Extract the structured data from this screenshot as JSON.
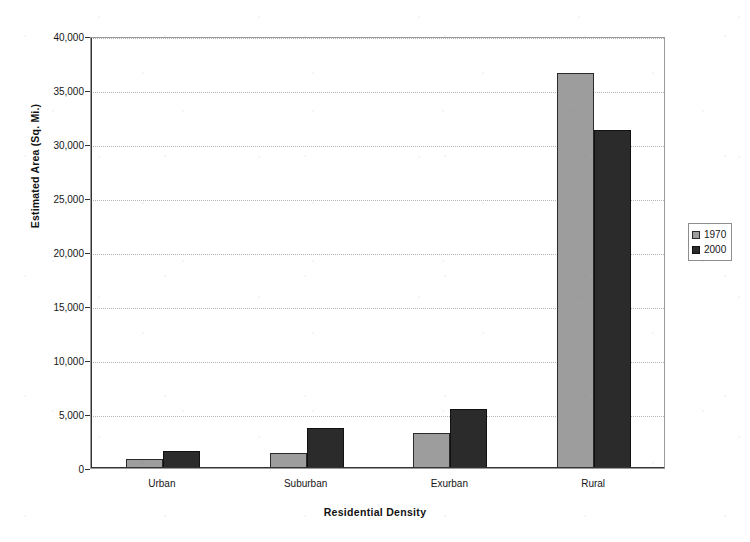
{
  "chart_data": {
    "type": "bar",
    "title": "",
    "xlabel": "Residential Density",
    "ylabel": "Estimated Area (Sq. Mi.)",
    "categories": [
      "Urban",
      "Suburban",
      "Exurban",
      "Rural"
    ],
    "series": [
      {
        "name": "1970",
        "color": "#9d9d9d",
        "values": [
          800,
          1400,
          3200,
          36600
        ]
      },
      {
        "name": "2000",
        "color": "#2b2b2b",
        "values": [
          1600,
          3700,
          5500,
          31300
        ]
      }
    ],
    "ylim": [
      0,
      40000
    ],
    "ytick_values": [
      0,
      5000,
      10000,
      15000,
      20000,
      25000,
      30000,
      35000,
      40000
    ],
    "ytick_labels": [
      "0",
      "5,000",
      "10,000",
      "15,000",
      "20,000",
      "25,000",
      "30,000",
      "35,000",
      "40,000"
    ],
    "grid": true,
    "legend_position": "right",
    "legend_entries": [
      "1970",
      "2000"
    ]
  },
  "axes": {
    "y_title": "Estimated Area (Sq. Mi.)",
    "x_title": "Residential Density"
  },
  "legend": {
    "items": [
      {
        "label": "1970"
      },
      {
        "label": "2000"
      }
    ]
  }
}
